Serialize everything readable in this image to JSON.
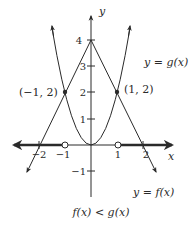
{
  "diagram": {
    "axes": {
      "x_label": "x",
      "y_label": "y",
      "x_ticks": [
        {
          "value": -2,
          "label": "−2"
        },
        {
          "value": -1,
          "label": "−1"
        },
        {
          "value": 1,
          "label": "1"
        },
        {
          "value": 2,
          "label": "2"
        }
      ],
      "y_ticks": [
        {
          "value": 4,
          "label": "4"
        },
        {
          "value": 3,
          "label": "3"
        },
        {
          "value": 2,
          "label": "2"
        },
        {
          "value": 1,
          "label": "1"
        },
        {
          "value": -1,
          "label": "−1"
        }
      ]
    },
    "curves": {
      "f": {
        "label": "y = f(x)",
        "equation": "f(x) = 2x^2"
      },
      "g": {
        "label": "y = g(x)",
        "equation": "g(x) = 4 - 2|x|"
      }
    },
    "points": [
      {
        "label": "(−1, 2)",
        "x": -1,
        "y": 2
      },
      {
        "label": "(1, 2)",
        "x": 1,
        "y": 2
      }
    ],
    "open_circles": [
      {
        "x": -1,
        "y": 0
      },
      {
        "x": 1,
        "y": 0
      }
    ],
    "caption": "f(x) < g(x)",
    "colors": {
      "ink": "#2a2a2a",
      "background": "#ffffff"
    }
  }
}
